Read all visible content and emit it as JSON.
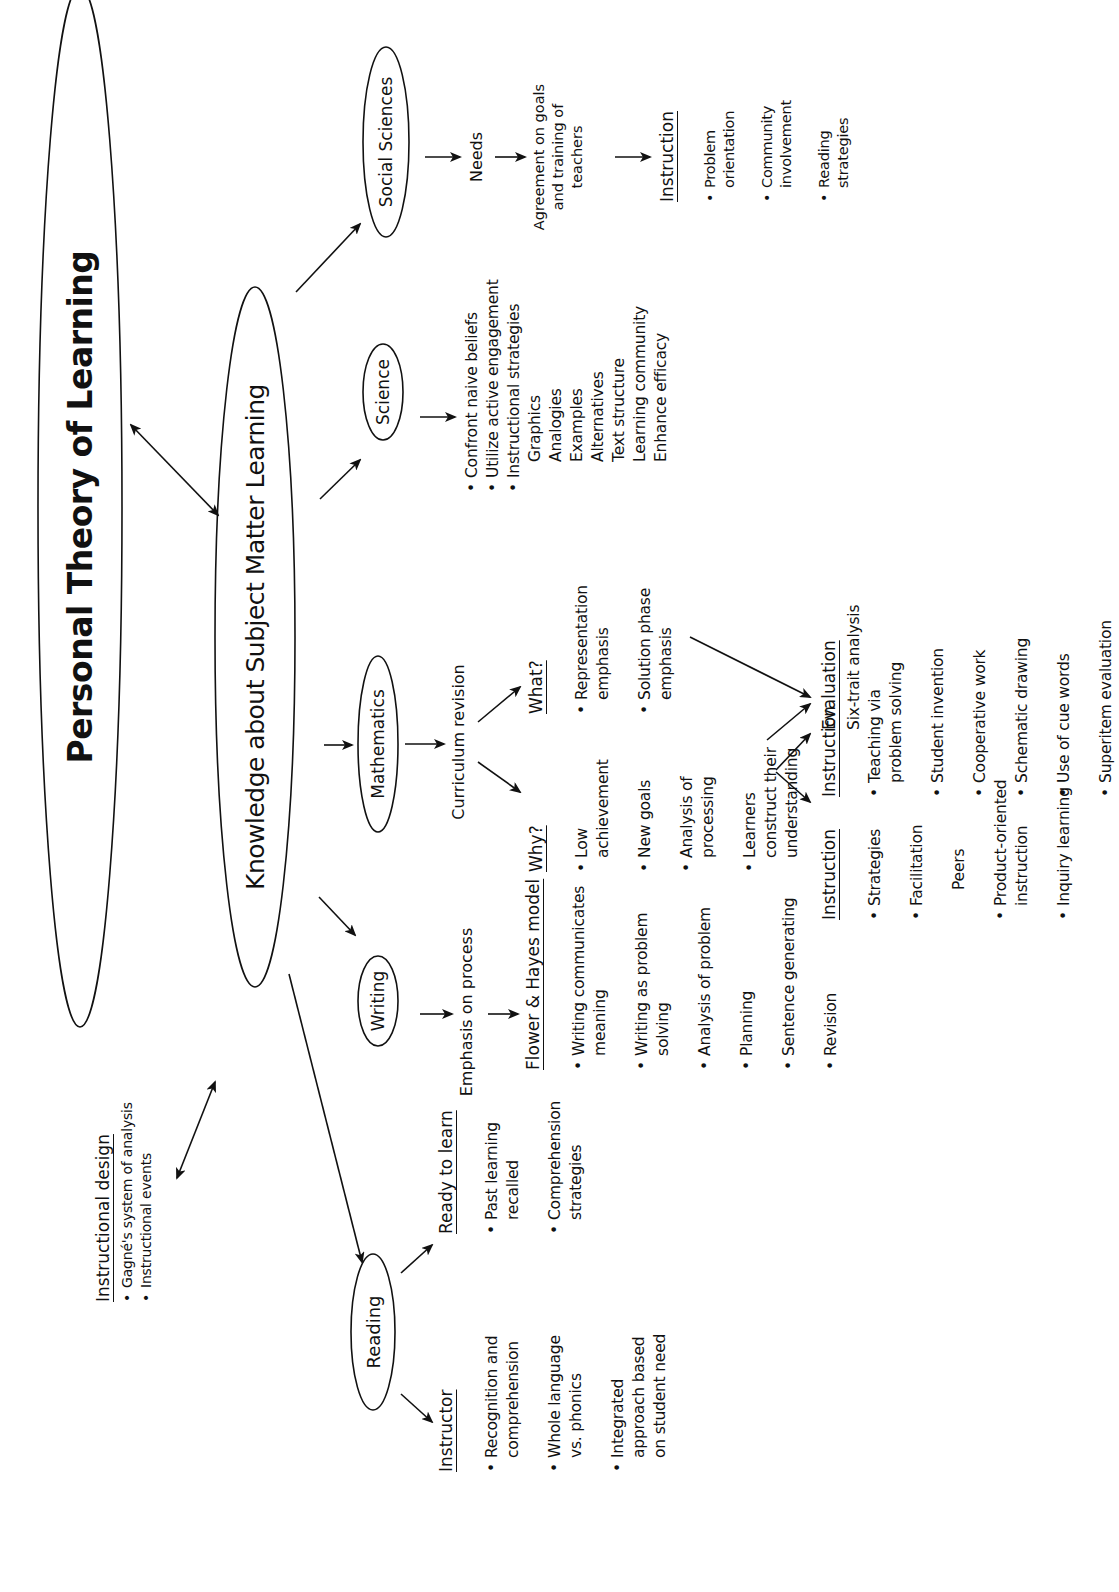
{
  "title": "Personal Theory of Learning",
  "hub": "Knowledge about Subject Matter Learning",
  "instructional_design": {
    "heading": "Instructional design",
    "items": [
      "Gagné's system of analysis",
      "Instructional events"
    ]
  },
  "subjects": {
    "reading": {
      "label": "Reading",
      "instructor": {
        "heading": "Instructor",
        "items": [
          "Recognition and\ncomprehension",
          "Whole language\nvs. phonics",
          "Integrated\napproach based\non student need"
        ]
      },
      "ready": {
        "heading": "Ready to learn",
        "items": [
          "Past learning\nrecalled",
          "Comprehension\nstrategies"
        ]
      }
    },
    "writing": {
      "label": "Writing",
      "emphasis": "Emphasis on process",
      "model": {
        "heading": "Flower & Hayes model",
        "items": [
          "Writing communicates\nmeaning",
          "Writing as problem\nsolving",
          "Analysis of problem",
          "Planning",
          "Sentence generating",
          "Revision"
        ]
      },
      "instruction": {
        "heading": "Instruction",
        "items": [
          "Strategies",
          "Facilitation",
          "Product-oriented\ninstruction",
          "Inquiry learning"
        ],
        "sub_item": "Peers"
      },
      "evaluation": {
        "heading": "Evaluation",
        "text": "Six-trait analysis"
      }
    },
    "mathematics": {
      "label": "Mathematics",
      "curriculum": "Curriculum revision",
      "why": {
        "heading": "Why?",
        "items": [
          "Low\nachievement",
          "New goals",
          "Analysis of\nprocessing",
          "Learners\nconstruct their\nunderstanding"
        ]
      },
      "what": {
        "heading": "What?",
        "items": [
          "Representation\nemphasis",
          "Solution phase\nemphasis"
        ]
      },
      "instruction": {
        "heading": "Instruction",
        "items": [
          "Teaching via\nproblem solving",
          "Student invention",
          "Cooperative work",
          "Schematic drawing",
          "Use of cue words",
          "Superitem evaluation"
        ]
      }
    },
    "science": {
      "label": "Science",
      "items": [
        "Confront naive beliefs",
        "Utilize active engagement",
        "Instructional strategies"
      ],
      "sub_items": [
        "Graphics",
        "Analogies",
        "Examples",
        "Alternatives",
        "Text structure",
        "Learning community",
        "Enhance efficacy"
      ]
    },
    "social_sciences": {
      "label": "Social Sciences",
      "needs": "Needs",
      "agreement": "Agreement on goals\nand training of\nteachers",
      "instruction": {
        "heading": "Instruction",
        "items": [
          "Problem\norientation",
          "Community\ninvolvement",
          "Reading\nstrategies"
        ]
      }
    }
  }
}
